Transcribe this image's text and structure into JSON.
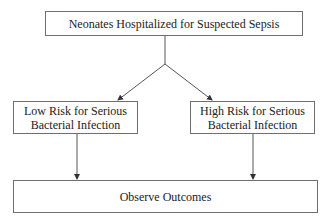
{
  "diagram": {
    "top_node": {
      "label": "Neonates Hospitalized for Suspected Sepsis"
    },
    "left_node": {
      "line1": "Low Risk for Serious",
      "line2": "Bacterial Infection"
    },
    "right_node": {
      "line1": "High Risk for Serious",
      "line2": "Bacterial Infection"
    },
    "bottom_node": {
      "label": "Observe Outcomes"
    },
    "colors": {
      "stroke": "#555555",
      "text": "#222222"
    }
  }
}
